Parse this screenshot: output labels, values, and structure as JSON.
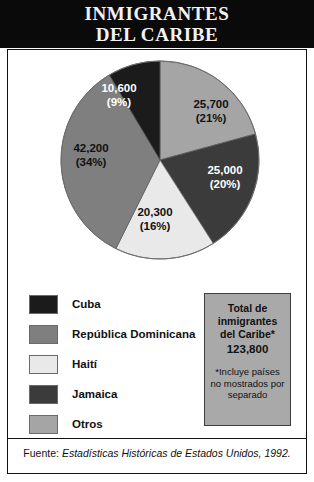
{
  "title": {
    "line1": "INMIGRANTES",
    "line2": "DEL CARIBE"
  },
  "chart_data": {
    "type": "pie",
    "title": "INMIGRANTES DEL CARIBE",
    "categories": [
      "Otros",
      "Jamaica",
      "Haití",
      "República Dominicana",
      "Cuba"
    ],
    "values": [
      25700,
      25000,
      20300,
      42200,
      10600
    ],
    "percent": [
      21,
      20,
      16,
      34,
      9
    ],
    "value_labels": [
      "25,700",
      "25,000",
      "20,300",
      "42,200",
      "10,600"
    ],
    "percent_labels": [
      "(21%)",
      "(20%)",
      "(16%)",
      "(34%)",
      "(9%)"
    ],
    "colors": [
      "#a5a5a5",
      "#3b3b3b",
      "#e9e9e9",
      "#7f7f7f",
      "#1b1b1b"
    ],
    "start_angle_deg": 0,
    "direction": "clockwise",
    "total": 123800,
    "legend_position": "bottom-left"
  },
  "legend": {
    "items": [
      {
        "label": "Cuba",
        "color": "#1b1b1b"
      },
      {
        "label": "República Dominicana",
        "color": "#7f7f7f"
      },
      {
        "label": "Haití",
        "color": "#e9e9e9"
      },
      {
        "label": "Jamaica",
        "color": "#3b3b3b"
      },
      {
        "label": "Otros",
        "color": "#a5a5a5"
      }
    ]
  },
  "total_box": {
    "title": "Total de inmigrantes del Caribe*",
    "value": "123,800",
    "note": "*Incluye países no mostrados por separado"
  },
  "source": {
    "label": "Fuente: ",
    "publication": "Estadísticas Históricas de Estados Unidos, 1992."
  }
}
